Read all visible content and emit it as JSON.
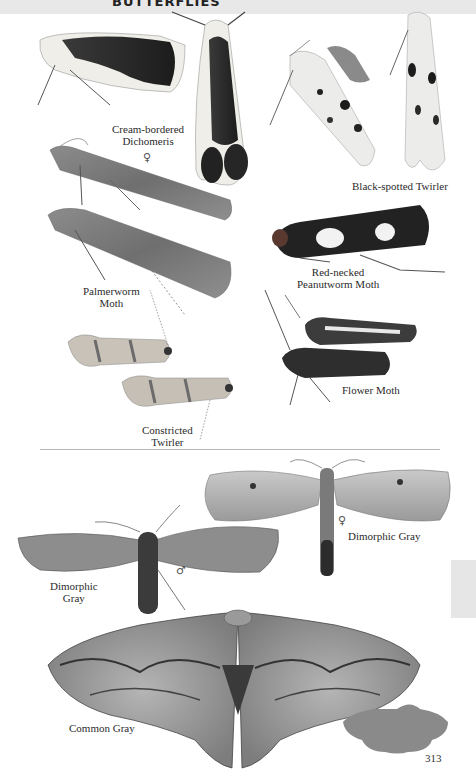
{
  "page": {
    "header_title": "BUTTERFLIES",
    "page_number": "313",
    "thumb_tab_color": "#e6e6e6",
    "divider_color": "#b5b5b5"
  },
  "upper_section": {
    "species": [
      {
        "name_lines": [
          "Cream-bordered",
          "Dichomeris"
        ],
        "icon": "moth-dark-with-cream-border"
      },
      {
        "name_lines": [
          "Black-spotted Twirler"
        ],
        "icon": "moth-white-black-spotted"
      },
      {
        "name_lines": [
          "Palmerworm",
          "Moth"
        ],
        "icon": "moth-gray-mottled",
        "sex_mark": "♀"
      },
      {
        "name_lines": [
          "Red-necked",
          "Peanutworm Moth"
        ],
        "icon": "moth-black-white-banded"
      },
      {
        "name_lines": [
          "Flower Moth"
        ],
        "icon": "moth-dark-brown"
      },
      {
        "name_lines": [
          "Constricted",
          "Twirler"
        ],
        "icon": "moth-tan-banded"
      }
    ]
  },
  "lower_section": {
    "species": [
      {
        "name_lines": [
          "Dimorphic Gray"
        ],
        "sex_mark": "♀",
        "icon": "moth-pale-gray-spread"
      },
      {
        "name_lines": [
          "Dimorphic",
          "Gray"
        ],
        "sex_mark": "♂",
        "icon": "moth-brown-gray-spread"
      },
      {
        "name_lines": [
          "Common Gray"
        ],
        "icon": "moth-gray-patterned-spread"
      }
    ]
  },
  "silhouettes": [
    {
      "label": "size-silhouette-small",
      "color": "#8a8a8a"
    },
    {
      "label": "size-silhouette-large",
      "color": "#8a8a8a"
    }
  ]
}
